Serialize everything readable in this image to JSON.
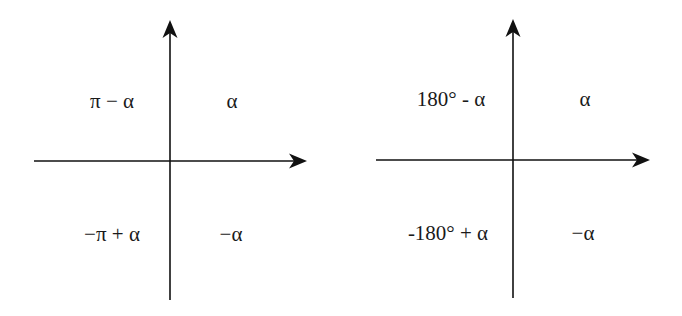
{
  "diagrams": [
    {
      "name": "radians",
      "quadrants": {
        "q1": "α",
        "q2": "π − α",
        "q3": "−π + α",
        "q4": "−α"
      }
    },
    {
      "name": "degrees",
      "quadrants": {
        "q1": "α",
        "q2": "180° - α",
        "q3": "-180° + α",
        "q4": "−α"
      }
    }
  ],
  "colors": {
    "axis": "#111111",
    "text": "#1a1a1a",
    "background": "#ffffff"
  }
}
